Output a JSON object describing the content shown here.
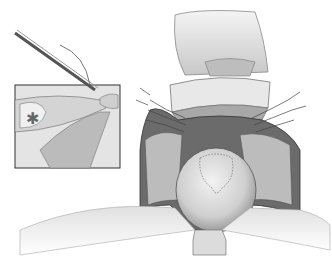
{
  "illustration": {
    "kind": "surgical-illustration",
    "style": "grayscale pencil drawing",
    "colors": {
      "background": "#ffffff",
      "line": "#3a3a3a",
      "tissue_light": "#e6e6e6",
      "tissue_mid": "#bdbdbd",
      "tissue_dark": "#6e6e6e",
      "cavity_dark": "#2e2e2e"
    },
    "inset": {
      "present": true,
      "description": "magnified view of forceps placing suture",
      "star_marker": "✱"
    },
    "main_view": {
      "description": "open surgical field with retracted flaps, sutures on both sides, and central rounded organ with dotted outline"
    }
  }
}
